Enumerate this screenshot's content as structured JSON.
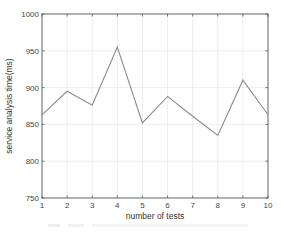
{
  "chart_data": {
    "type": "line",
    "title": "",
    "xlabel": "number of tests",
    "ylabel": "service analysis time(ms)",
    "x": [
      1,
      2,
      3,
      4,
      5,
      6,
      7,
      8,
      9,
      10
    ],
    "series": [
      {
        "name": "service analysis time",
        "values": [
          863,
          895,
          876,
          955,
          852,
          888,
          861,
          835,
          910,
          863
        ]
      }
    ],
    "xlim": [
      1,
      10
    ],
    "ylim": [
      750,
      1000
    ],
    "xticks": [
      "1",
      "2",
      "3",
      "4",
      "5",
      "6",
      "7",
      "8",
      "9",
      "10"
    ],
    "yticks": [
      "750",
      "800",
      "850",
      "900",
      "950",
      "1000"
    ],
    "grid": true,
    "legend": null,
    "line_color": "#8c8c8c",
    "grid_color": "#e6e6e6",
    "axis_color": "#555555"
  }
}
